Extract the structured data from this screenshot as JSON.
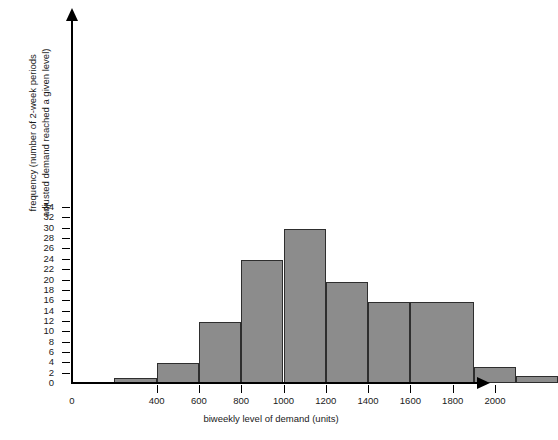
{
  "chart_data": {
    "type": "bar",
    "title": "",
    "xlabel": "biweekly level of demand (units)",
    "ylabel": "frequency (number of 2-week periods adjusted demand reached a given level)",
    "ylabel_line1": "frequency (number of 2-week periods",
    "ylabel_line2": "adjusted demand reached a given level)",
    "grid": false,
    "legend": "none",
    "bar_color": "#8c8c8c",
    "bar_edge_color": "#2e2e2e",
    "axis_color": "#000000",
    "bin_width": 200,
    "xlim": [
      0,
      2200
    ],
    "ylim": [
      0,
      35
    ],
    "xticks": [
      0,
      400,
      600,
      800,
      1000,
      1200,
      1400,
      1600,
      1800,
      2000
    ],
    "xtick_labels": [
      "0",
      "400",
      "600",
      "800",
      "1000",
      "1200",
      "1400",
      "1600",
      "1800",
      "2000"
    ],
    "yticks": [
      0,
      2,
      4,
      6,
      8,
      10,
      12,
      14,
      16,
      18,
      20,
      22,
      24,
      26,
      28,
      30,
      32,
      34
    ],
    "ytick_labels": [
      "0",
      "2",
      "4",
      "6",
      "8",
      "10",
      "12",
      "14",
      "16",
      "18",
      "20",
      "22",
      "24",
      "26",
      "28",
      "30",
      "32",
      "34"
    ],
    "bins": [
      {
        "start": 200,
        "end": 400,
        "value": 1.0
      },
      {
        "start": 400,
        "end": 600,
        "value": 3.8
      },
      {
        "start": 600,
        "end": 800,
        "value": 11.8
      },
      {
        "start": 800,
        "end": 1000,
        "value": 23.7
      },
      {
        "start": 1000,
        "end": 1200,
        "value": 29.7
      },
      {
        "start": 1200,
        "end": 1400,
        "value": 19.6
      },
      {
        "start": 1400,
        "end": 1600,
        "value": 15.6
      },
      {
        "start": 1600,
        "end": 1900,
        "value": 15.6
      },
      {
        "start": 1900,
        "end": 2100,
        "value": 3.1
      },
      {
        "start": 2100,
        "end": 2300,
        "value": 1.3
      }
    ],
    "categories": [
      "200-400",
      "400-600",
      "600-800",
      "800-1000",
      "1000-1200",
      "1200-1400",
      "1400-1600",
      "1600-1800",
      "1800-2000",
      "2000-2200"
    ],
    "values": [
      1.0,
      3.8,
      11.8,
      23.7,
      29.7,
      19.6,
      15.6,
      15.6,
      3.1,
      1.3
    ]
  }
}
